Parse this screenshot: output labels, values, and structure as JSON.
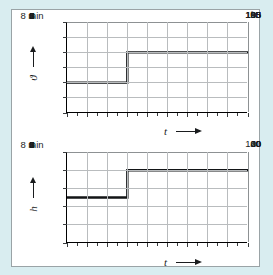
{
  "figure": {
    "background_color": "#d9edf0",
    "panel_color": "#ffffff",
    "border_color": "#9aa3a6",
    "curve_color": "#121416",
    "grid_color": "#b9bcbe",
    "connector_label": "step-marker-t3"
  },
  "chart_data": [
    {
      "type": "line",
      "id": "temperature-step",
      "title": "",
      "xlabel": "t",
      "ylabel": "ϑ",
      "x_unit": "min",
      "y_unit": "°C",
      "x": [
        0,
        3,
        3,
        9
      ],
      "values": [
        95,
        95,
        105,
        105
      ],
      "xlim": [
        0,
        9
      ],
      "ylim": [
        85,
        115
      ],
      "xticks": [
        0,
        1,
        2,
        3,
        4,
        5,
        6,
        7,
        8,
        9
      ],
      "xtick_labels": [
        "0",
        "1",
        "2",
        "3",
        "4",
        "5",
        "6",
        "7",
        "8 min",
        "9"
      ],
      "yticks": [
        85,
        90,
        95,
        100,
        105,
        110,
        115
      ],
      "ytick_labels": [
        "85",
        "90",
        "95",
        "100",
        "105",
        "°C",
        "115"
      ],
      "minor_x_step": 0.5,
      "grid": true,
      "legend": "none",
      "annotations": [
        {
          "text": "step up at t = 3 min from 95 °C to 105 °C"
        }
      ]
    },
    {
      "type": "line",
      "id": "level-step",
      "title": "",
      "xlabel": "t",
      "ylabel": "h",
      "x_unit": "min",
      "y_unit": "%",
      "x": [
        0,
        3,
        3,
        9
      ],
      "values": [
        50,
        50,
        80,
        80
      ],
      "xlim": [
        0,
        9
      ],
      "ylim": [
        0,
        100
      ],
      "xticks": [
        0,
        1,
        2,
        3,
        4,
        5,
        6,
        7,
        8,
        9
      ],
      "xtick_labels": [
        "0",
        "1",
        "2",
        "3",
        "4",
        "5",
        "6",
        "7",
        "8 min",
        "9"
      ],
      "yticks": [
        0,
        20,
        40,
        60,
        80,
        100
      ],
      "ytick_labels": [
        "0",
        "20",
        "40",
        "60",
        "%",
        "100"
      ],
      "minor_x_step": 0.5,
      "grid": true,
      "legend": "none",
      "annotations": [
        {
          "text": "step up at t = 3 min from 50 % to 80 %"
        }
      ]
    }
  ]
}
